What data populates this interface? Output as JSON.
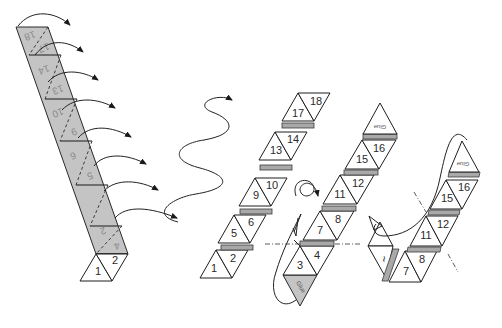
{
  "diagram": {
    "type": "folding-instructions",
    "step1": {
      "description": "gray strip folded along dashed lines, arrows show folding direction",
      "ghost_labels": [
        "18",
        "17",
        "14",
        "13",
        "10",
        "9",
        "6",
        "5",
        "2",
        "4"
      ],
      "visible_labels": [
        "1",
        "2"
      ]
    },
    "step2": {
      "description": "strip after wave folding",
      "labels": [
        "1",
        "2",
        "5",
        "6",
        "9",
        "10",
        "13",
        "14",
        "17",
        "18"
      ]
    },
    "step3": {
      "description": "strip turned over with glue flap",
      "labels": [
        "3",
        "4",
        "7",
        "8",
        "11",
        "12",
        "15",
        "16"
      ],
      "glue_top": "Glue",
      "glue_bottom": "Glue"
    },
    "step4": {
      "description": "strip wrapped around to glue",
      "labels": [
        "7",
        "8",
        "11",
        "12",
        "15",
        "16"
      ],
      "rotated_label": "~",
      "glue_top": "Glue"
    }
  }
}
